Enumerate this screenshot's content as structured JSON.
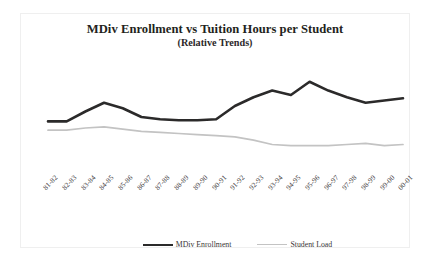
{
  "chart_data": {
    "type": "line",
    "title": "MDiv Enrollment vs Tuition Hours per Student",
    "subtitle": "(Relative Trends)",
    "xlabel": "",
    "ylabel": "",
    "grid": false,
    "legend_position": "bottom",
    "axis_visible": false,
    "ylim": [
      0,
      100
    ],
    "categories": [
      "81-82",
      "82-83",
      "83-84",
      "84-85",
      "85-86",
      "86-87",
      "87-88",
      "88-89",
      "89-90",
      "90-91",
      "91-92",
      "92-93",
      "93-94",
      "94-95",
      "95-96",
      "96-97",
      "97-98",
      "98-99",
      "99-00",
      "00-01"
    ],
    "series": [
      {
        "name": "MDiv Enrollment",
        "color": "#2b2a2a",
        "line_width": 2.6,
        "values": [
          46,
          46,
          55,
          63,
          58,
          50,
          48,
          47,
          47,
          48,
          60,
          68,
          74,
          70,
          82,
          74,
          68,
          63,
          65,
          67
        ]
      },
      {
        "name": "Student Load",
        "color": "#c3c3c3",
        "line_width": 1.7,
        "values": [
          38,
          38,
          40,
          41,
          39,
          37,
          36,
          35,
          34,
          33,
          32,
          29,
          25,
          24,
          24,
          24,
          25,
          26,
          24,
          25
        ]
      }
    ]
  },
  "legend": {
    "entries": [
      {
        "label": "MDiv Enrollment"
      },
      {
        "label": "Student Load"
      }
    ]
  }
}
